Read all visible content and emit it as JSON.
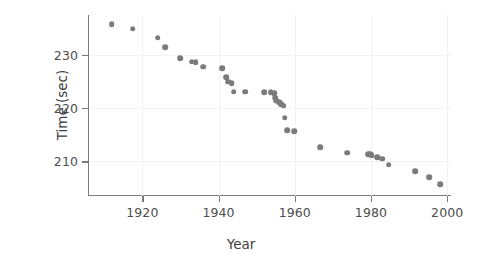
{
  "chart_data": {
    "type": "scatter",
    "title": "",
    "xlabel": "Year",
    "ylabel": "Time (sec)",
    "xlim": [
      1906,
      2001
    ],
    "ylim": [
      203.5,
      237.5
    ],
    "xticks": [
      1920,
      1940,
      1960,
      1980,
      2000
    ],
    "xticklabels": [
      "1920",
      "1940",
      "1960",
      "1980",
      "2000"
    ],
    "yticks": [
      210,
      220,
      230
    ],
    "yticklabels": [
      "210",
      "220",
      "230"
    ],
    "grid": true,
    "grid_color": "#f2f2f2",
    "marker_color": "#7b7b7b",
    "marker_size": 5.6,
    "legend": null,
    "series": [
      {
        "name": "Winning time",
        "points": [
          [
            1912,
            235.8
          ],
          [
            1917.5,
            234.9
          ],
          [
            1924,
            233.2
          ],
          [
            1926,
            231.5
          ],
          [
            1930,
            229.4
          ],
          [
            1933,
            228.7
          ],
          [
            1934,
            228.6
          ],
          [
            1936,
            227.8
          ],
          [
            1941,
            227.5
          ],
          [
            1942,
            225.8
          ],
          [
            1942.6,
            225.0
          ],
          [
            1943.5,
            224.7
          ],
          [
            1944,
            223.1
          ],
          [
            1947,
            223.1
          ],
          [
            1952,
            223.0
          ],
          [
            1953.7,
            223.0
          ],
          [
            1954.6,
            222.8
          ],
          [
            1954.8,
            222.0
          ],
          [
            1955.2,
            221.4
          ],
          [
            1955.9,
            221.1
          ],
          [
            1956.5,
            220.7
          ],
          [
            1957.1,
            220.5
          ],
          [
            1957.4,
            218.2
          ],
          [
            1958,
            215.9
          ],
          [
            1959.8,
            215.7
          ],
          [
            1966.6,
            212.7
          ],
          [
            1973.7,
            211.6
          ],
          [
            1979.2,
            211.3
          ],
          [
            1979.8,
            211.4
          ],
          [
            1980.2,
            211.2
          ],
          [
            1981.6,
            210.8
          ],
          [
            1983,
            210.5
          ],
          [
            1984.6,
            209.4
          ],
          [
            1991.6,
            208.2
          ],
          [
            1995.3,
            207.0
          ],
          [
            1998.2,
            205.7
          ]
        ]
      }
    ]
  },
  "axes": {
    "x_title": "Year",
    "y_title": "Time (sec)"
  }
}
